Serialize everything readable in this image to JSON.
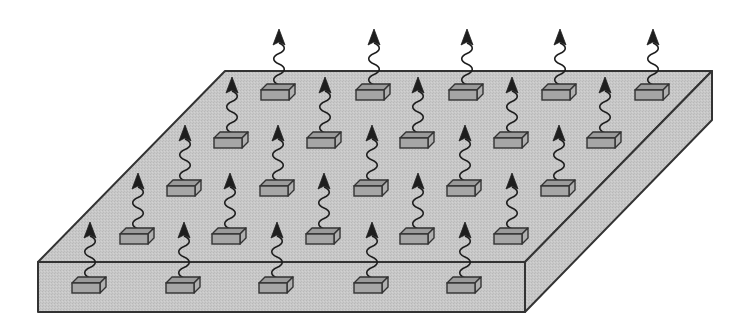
{
  "diagram": {
    "colors": {
      "background": "#ffffff",
      "slab_fill": "#c8c8c8",
      "slab_side": "#c4c4c4",
      "outline": "#333333",
      "block_top": "#9a9a9a",
      "block_front": "#a6a6a6",
      "block_side": "#b0b0b0",
      "arrow": "#1e1e1e"
    },
    "slab": {
      "top_face": [
        [
          225,
          71
        ],
        [
          712,
          71
        ],
        [
          525,
          262
        ],
        [
          38,
          262
        ]
      ],
      "front_face": [
        [
          38,
          262
        ],
        [
          525,
          262
        ],
        [
          525,
          312
        ],
        [
          38,
          312
        ]
      ],
      "side_face": [
        [
          712,
          71
        ],
        [
          712,
          120
        ],
        [
          525,
          312
        ],
        [
          525,
          262
        ]
      ]
    },
    "block_rows": [
      {
        "row": 1,
        "y": 90,
        "x": [
          277,
          372,
          465,
          558,
          651
        ]
      },
      {
        "row": 2,
        "y": 138,
        "x": [
          230,
          323,
          416,
          510,
          603
        ]
      },
      {
        "row": 3,
        "y": 186,
        "x": [
          183,
          276,
          370,
          463,
          557
        ]
      },
      {
        "row": 4,
        "y": 234,
        "x": [
          136,
          228,
          322,
          416,
          510
        ]
      },
      {
        "row": 5,
        "y": 283,
        "x": [
          88,
          182,
          275,
          370,
          463
        ]
      }
    ],
    "emitter_count": 25,
    "block_size": {
      "width": 28,
      "height": 10,
      "depth": 6
    },
    "arrow_length": 56
  }
}
